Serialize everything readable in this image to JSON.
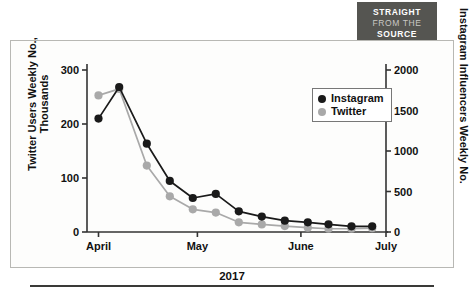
{
  "banner": {
    "line1": "STRAIGHT",
    "line2": "FROM THE",
    "line3": "SOURCE",
    "bg_color": "#555551"
  },
  "legend": {
    "position": "top-right-inside",
    "items": [
      {
        "label": "Instagram",
        "color": "#1a1a1a"
      },
      {
        "label": "Twitter",
        "color": "#a9a9a9"
      }
    ]
  },
  "chart_data": {
    "type": "line",
    "title": "",
    "subtitle": "",
    "xlabel": "2017",
    "ylabel": "Twitter Users Weekly No., Thousands",
    "y2label": "Instagram Influencers Weekly No.",
    "grid": false,
    "legend_position": "upper right",
    "xlim": [
      0,
      13
    ],
    "x_tick_labels": [
      "April",
      "May",
      "June",
      "July"
    ],
    "x_tick_positions": [
      0.5,
      4.8,
      9.3,
      13.0
    ],
    "ylim": [
      0,
      300
    ],
    "y_ticks": [
      0,
      100,
      200,
      300
    ],
    "y_tick_labels": [
      "0",
      "100",
      "200",
      "300"
    ],
    "y2lim": [
      0,
      2000
    ],
    "y2_ticks": [
      0,
      500,
      1000,
      1500,
      2000
    ],
    "y2_tick_labels": [
      "0",
      "500",
      "1000",
      "1500",
      "2000"
    ],
    "x": [
      0.5,
      1.4,
      2.6,
      3.6,
      4.6,
      5.6,
      6.6,
      7.6,
      8.6,
      9.6,
      10.5,
      11.5,
      12.4
    ],
    "series": [
      {
        "name": "Instagram",
        "axis": "right",
        "color": "#1a1a1a",
        "values": [
          1400,
          1790,
          1090,
          630,
          420,
          470,
          255,
          190,
          140,
          120,
          95,
          70,
          70
        ]
      },
      {
        "name": "Twitter",
        "axis": "left",
        "color": "#a9a9a9",
        "values": [
          253,
          265,
          123,
          66,
          42,
          36,
          18,
          14,
          11,
          8,
          6,
          6,
          7
        ]
      }
    ]
  }
}
